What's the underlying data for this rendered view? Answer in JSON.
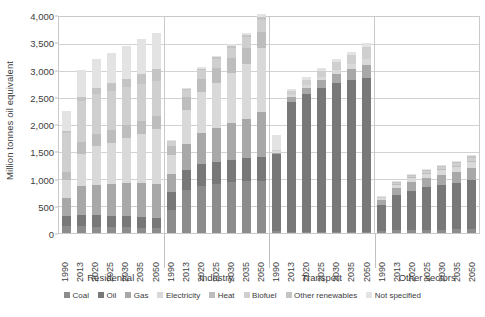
{
  "chart_data": {
    "type": "bar",
    "subtype": "stacked-bar-grouped",
    "title": "",
    "xlabel": "",
    "ylabel": "Million tonnes oil equivalent",
    "ylim": [
      0,
      4000
    ],
    "ytick_labels": [
      "0",
      "500",
      "1,000",
      "1,500",
      "2,000",
      "2,500",
      "3,000",
      "3,500",
      "4,000"
    ],
    "ytick_values": [
      0,
      500,
      1000,
      1500,
      2000,
      2500,
      3000,
      3500,
      4000
    ],
    "grid": true,
    "legend_position": "bottom",
    "categories": [
      "1990",
      "2013",
      "2020",
      "2025",
      "2030",
      "2035",
      "2050"
    ],
    "groups": [
      "Residential",
      "Industry",
      "Transport",
      "Other sectors"
    ],
    "series_names": [
      "Coal",
      "Oil",
      "Gas",
      "Electricity",
      "Heat",
      "Biofuel",
      "Other renewables",
      "Not specified"
    ],
    "series_colors": [
      "#8c8c8c",
      "#787878",
      "#a8a8a8",
      "#d9d9d9",
      "#bdbdbd",
      "#cfcfcf",
      "#c4c4c4",
      "#e3e3e3"
    ],
    "data": {
      "Residential": {
        "1990": {
          "Coal": 130,
          "Oil": 175,
          "Gas": 340,
          "Electricity": 320,
          "Heat": 150,
          "Biofuel": 720,
          "Other renewables": 30,
          "Not specified": 370
        },
        "2013": {
          "Coal": 120,
          "Oil": 215,
          "Gas": 520,
          "Electricity": 600,
          "Heat": 215,
          "Biofuel": 750,
          "Other renewables": 80,
          "Not specified": 500
        },
        "2020": {
          "Coal": 115,
          "Oil": 215,
          "Gas": 560,
          "Electricity": 700,
          "Heat": 230,
          "Biofuel": 740,
          "Other renewables": 110,
          "Not specified": 520
        },
        "2025": {
          "Coal": 110,
          "Oil": 210,
          "Gas": 580,
          "Electricity": 760,
          "Heat": 235,
          "Biofuel": 720,
          "Other renewables": 130,
          "Not specified": 565
        },
        "2030": {
          "Coal": 105,
          "Oil": 205,
          "Gas": 600,
          "Electricity": 830,
          "Heat": 240,
          "Biofuel": 700,
          "Other renewables": 150,
          "Not specified": 600
        },
        "2035": {
          "Coal": 100,
          "Oil": 200,
          "Gas": 615,
          "Electricity": 900,
          "Heat": 245,
          "Biofuel": 680,
          "Other renewables": 175,
          "Not specified": 655
        },
        "2050": {
          "Coal": 90,
          "Oil": 190,
          "Gas": 620,
          "Electricity": 1000,
          "Heat": 250,
          "Biofuel": 640,
          "Other renewables": 225,
          "Not specified": 665
        }
      },
      "Industry": {
        "1990": {
          "Coal": 430,
          "Oil": 320,
          "Gas": 330,
          "Electricity": 360,
          "Heat": 150,
          "Biofuel": 90,
          "Other renewables": 10,
          "Not specified": 10
        },
        "2013": {
          "Coal": 790,
          "Oil": 360,
          "Gas": 480,
          "Electricity": 630,
          "Heat": 230,
          "Biofuel": 140,
          "Other renewables": 20,
          "Not specified": 20
        },
        "2020": {
          "Coal": 870,
          "Oil": 390,
          "Gas": 570,
          "Electricity": 750,
          "Heat": 250,
          "Biofuel": 160,
          "Other renewables": 25,
          "Not specified": 25
        },
        "2025": {
          "Coal": 900,
          "Oil": 400,
          "Gas": 620,
          "Electricity": 840,
          "Heat": 260,
          "Biofuel": 175,
          "Other renewables": 30,
          "Not specified": 30
        },
        "2030": {
          "Coal": 930,
          "Oil": 410,
          "Gas": 670,
          "Electricity": 930,
          "Heat": 270,
          "Biofuel": 190,
          "Other renewables": 35,
          "Not specified": 35
        },
        "2035": {
          "Coal": 950,
          "Oil": 420,
          "Gas": 720,
          "Electricity": 1020,
          "Heat": 280,
          "Biofuel": 205,
          "Other renewables": 40,
          "Not specified": 40
        },
        "2050": {
          "Coal": 960,
          "Oil": 430,
          "Gas": 830,
          "Electricity": 1180,
          "Heat": 290,
          "Biofuel": 225,
          "Other renewables": 50,
          "Not specified": 50
        }
      },
      "Transport": {
        "1990": {
          "Coal": 35,
          "Oil": 1420,
          "Gas": 20,
          "Electricity": 30,
          "Heat": 0,
          "Biofuel": 10,
          "Other renewables": 0,
          "Not specified": 285
        },
        "2013": {
          "Coal": 20,
          "Oil": 2390,
          "Gas": 90,
          "Electricity": 35,
          "Heat": 0,
          "Biofuel": 70,
          "Other renewables": 0,
          "Not specified": 45
        },
        "2020": {
          "Coal": 18,
          "Oil": 2530,
          "Gas": 120,
          "Electricity": 45,
          "Heat": 0,
          "Biofuel": 95,
          "Other renewables": 0,
          "Not specified": 50
        },
        "2025": {
          "Coal": 16,
          "Oil": 2650,
          "Gas": 145,
          "Electricity": 55,
          "Heat": 0,
          "Biofuel": 115,
          "Other renewables": 0,
          "Not specified": 55
        },
        "2030": {
          "Coal": 15,
          "Oil": 2740,
          "Gas": 170,
          "Electricity": 70,
          "Heat": 0,
          "Biofuel": 140,
          "Other renewables": 0,
          "Not specified": 60
        },
        "2035": {
          "Coal": 14,
          "Oil": 2800,
          "Gas": 195,
          "Electricity": 85,
          "Heat": 0,
          "Biofuel": 165,
          "Other renewables": 0,
          "Not specified": 65
        },
        "2050": {
          "Coal": 12,
          "Oil": 2840,
          "Gas": 230,
          "Electricity": 120,
          "Heat": 0,
          "Biofuel": 210,
          "Other renewables": 0,
          "Not specified": 75
        }
      },
      "Other sectors": {
        "1990": {
          "Coal": 40,
          "Oil": 470,
          "Gas": 90,
          "Electricity": 40,
          "Heat": 10,
          "Biofuel": 15,
          "Other renewables": 5,
          "Not specified": 10
        },
        "2013": {
          "Coal": 55,
          "Oil": 640,
          "Gas": 130,
          "Electricity": 60,
          "Heat": 15,
          "Biofuel": 25,
          "Other renewables": 10,
          "Not specified": 15
        },
        "2020": {
          "Coal": 60,
          "Oil": 720,
          "Gas": 155,
          "Electricity": 70,
          "Heat": 18,
          "Biofuel": 30,
          "Other renewables": 12,
          "Not specified": 15
        },
        "2025": {
          "Coal": 62,
          "Oil": 775,
          "Gas": 170,
          "Electricity": 78,
          "Heat": 20,
          "Biofuel": 35,
          "Other renewables": 15,
          "Not specified": 15
        },
        "2030": {
          "Coal": 64,
          "Oil": 820,
          "Gas": 185,
          "Electricity": 86,
          "Heat": 22,
          "Biofuel": 40,
          "Other renewables": 18,
          "Not specified": 15
        },
        "2035": {
          "Coal": 66,
          "Oil": 855,
          "Gas": 200,
          "Electricity": 94,
          "Heat": 24,
          "Biofuel": 45,
          "Other renewables": 21,
          "Not specified": 15
        },
        "2050": {
          "Coal": 68,
          "Oil": 900,
          "Gas": 225,
          "Electricity": 110,
          "Heat": 26,
          "Biofuel": 55,
          "Other renewables": 26,
          "Not specified": 15
        }
      }
    }
  }
}
